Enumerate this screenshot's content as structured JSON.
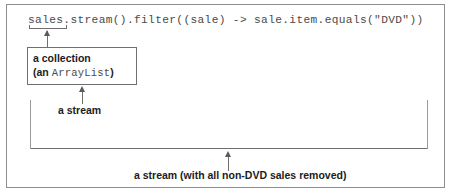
{
  "figure": {
    "code_line": "sales.stream().filter((sale) -> sale.item.equals(\"DVD\"))",
    "annotations": {
      "collection": {
        "line1": "a collection",
        "line2_prefix": "(an ",
        "line2_mono": "ArrayList",
        "line2_suffix": ")"
      },
      "stream_label": "a stream",
      "result_label": "a stream (with all non-DVD sales removed)"
    },
    "colors": {
      "frame_border": "#8d8d8d",
      "rule": "#6f6f6f",
      "rule_light": "#9a9a9a",
      "code_text": "#4a4a4a",
      "label_text": "#1c1c1c",
      "background": "#ffffff"
    }
  }
}
